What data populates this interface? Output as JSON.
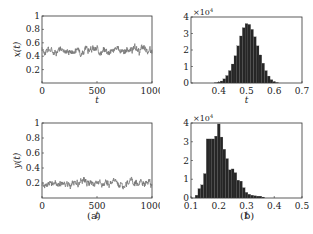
{
  "figure": {
    "caption_a": "(a)",
    "caption_b": "(b)"
  },
  "colors": {
    "line": "#777777",
    "bar": "#262626",
    "axis": "#333333"
  },
  "chart_data": [
    {
      "id": "top-left",
      "type": "line",
      "title": "",
      "xlabel": "t",
      "ylabel": "x(t)",
      "xlim": [
        0,
        1000
      ],
      "ylim": [
        0,
        1
      ],
      "xticks": [
        0,
        500,
        1000
      ],
      "yticks": [
        0.2,
        0.4,
        0.6,
        0.8,
        1
      ],
      "ytick_labels": [
        "0.2",
        "0.4",
        "0.6",
        "0.8",
        "1"
      ],
      "series": [
        {
          "name": "x(t)",
          "mean": 0.49,
          "noise_amplitude": 0.06,
          "description": "noisy fluctuation around ~0.49, range ~0.40-0.60"
        }
      ]
    },
    {
      "id": "top-right",
      "type": "bar",
      "title": "",
      "xlabel": "t",
      "ylabel": "",
      "y_multiplier": "×10^4",
      "xlim": [
        0.3,
        0.7
      ],
      "ylim": [
        0,
        4
      ],
      "xticks": [
        0.4,
        0.5,
        0.6,
        0.7
      ],
      "yticks": [
        0,
        1,
        2,
        3,
        4
      ],
      "categories": [
        0.39,
        0.4,
        0.41,
        0.42,
        0.43,
        0.44,
        0.45,
        0.46,
        0.47,
        0.48,
        0.49,
        0.5,
        0.51,
        0.52,
        0.53,
        0.54,
        0.55,
        0.56,
        0.57,
        0.58,
        0.59,
        0.6,
        0.61
      ],
      "values": [
        0.02,
        0.05,
        0.12,
        0.25,
        0.45,
        0.75,
        1.15,
        1.65,
        2.25,
        2.85,
        3.35,
        3.6,
        3.55,
        3.25,
        2.8,
        2.25,
        1.7,
        1.2,
        0.75,
        0.42,
        0.2,
        0.08,
        0.03
      ]
    },
    {
      "id": "bottom-left",
      "type": "line",
      "title": "",
      "xlabel": "t",
      "ylabel": "y(t)",
      "xlim": [
        0,
        1000
      ],
      "ylim": [
        0,
        1
      ],
      "xticks": [
        0,
        500,
        1000
      ],
      "yticks": [
        0.2,
        0.4,
        0.6,
        0.8,
        1
      ],
      "ytick_labels": [
        "0.2",
        "0.4",
        "0.6",
        "0.8",
        "1"
      ],
      "series": [
        {
          "name": "y(t)",
          "mean": 0.19,
          "noise_amplitude": 0.05,
          "description": "noisy fluctuation around ~0.19, peak ~0.35 near t=800"
        }
      ]
    },
    {
      "id": "bottom-right",
      "type": "bar",
      "title": "",
      "xlabel": "t",
      "ylabel": "",
      "y_multiplier": "×10^4",
      "xlim": [
        0.1,
        0.5
      ],
      "ylim": [
        0,
        4
      ],
      "xticks": [
        0.1,
        0.2,
        0.3,
        0.4,
        0.5
      ],
      "yticks": [
        0,
        1,
        2,
        3,
        4
      ],
      "categories": [
        0.12,
        0.13,
        0.14,
        0.15,
        0.16,
        0.17,
        0.18,
        0.19,
        0.2,
        0.21,
        0.22,
        0.23,
        0.24,
        0.25,
        0.26,
        0.27,
        0.28,
        0.29,
        0.3,
        0.31,
        0.32,
        0.33,
        0.34,
        0.35,
        0.36
      ],
      "values": [
        0.15,
        0.5,
        0.7,
        1.3,
        3.15,
        3.15,
        3.15,
        3.3,
        3.95,
        3.25,
        2.6,
        2.1,
        1.5,
        1.55,
        1.35,
        0.95,
        0.9,
        0.55,
        0.3,
        0.2,
        0.15,
        0.12,
        0.1,
        0.1,
        0.05
      ]
    }
  ]
}
